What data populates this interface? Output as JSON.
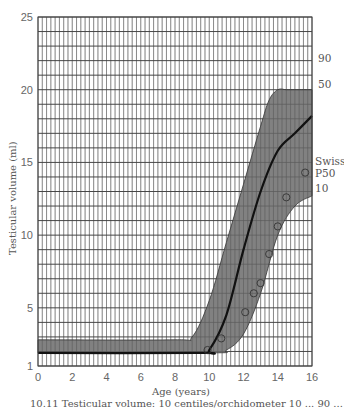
{
  "chart_data": {
    "type": "line",
    "title": "",
    "xlabel": "Age (years)",
    "ylabel": "Testicular volume (ml)",
    "xlim": [
      0,
      16
    ],
    "ylim": [
      1,
      25
    ],
    "x_ticks": [
      0,
      2,
      4,
      6,
      8,
      10,
      12,
      14,
      16
    ],
    "y_ticks": [
      1,
      5,
      10,
      15,
      20,
      25
    ],
    "grid": true,
    "series": [
      {
        "name": "90",
        "x": [
          0,
          8,
          9,
          10,
          11,
          12,
          13,
          13.5,
          14,
          14.5,
          15,
          16
        ],
        "values": [
          2.8,
          2.8,
          3.0,
          5.5,
          9.5,
          13.5,
          17.5,
          19.3,
          20,
          20,
          20,
          20
        ]
      },
      {
        "name": "50",
        "x": [
          0,
          9.5,
          10,
          11,
          12,
          13,
          14,
          15,
          16
        ],
        "values": [
          1.9,
          1.9,
          2.1,
          4.5,
          9.0,
          13.0,
          15.8,
          17.0,
          18.2
        ]
      },
      {
        "name": "10",
        "x": [
          0,
          10,
          11,
          12,
          13,
          14,
          15,
          16
        ],
        "values": [
          1.9,
          1.9,
          2.1,
          3.2,
          6.0,
          10.0,
          12.0,
          12.7
        ]
      },
      {
        "name": "Swiss P50",
        "marker": "circle",
        "x": [
          9.9,
          10.7,
          12.1,
          12.6,
          13.0,
          13.5,
          14.0,
          14.5,
          15.6
        ],
        "values": [
          2.1,
          2.9,
          4.7,
          6.0,
          6.7,
          8.7,
          10.6,
          12.6,
          14.3
        ]
      }
    ],
    "band": {
      "upper": "90",
      "lower": "10",
      "fill": "#6b6b6b"
    },
    "annotations": [
      "90",
      "50",
      "Swiss",
      "P50",
      "10"
    ]
  },
  "labels": {
    "pct90": "90",
    "pct50": "50",
    "swiss1": "Swiss",
    "swiss2": "P50",
    "pct10": "10",
    "xlabel": "Age (years)",
    "ylabel": "Testicular volume (ml)"
  },
  "caption": "10.11 Testicular volume: 10 centiles/orchidometer 10 ... 90 ... "
}
